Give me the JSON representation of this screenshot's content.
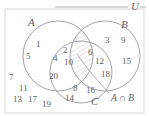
{
  "diagram": {
    "type": "venn-3-set",
    "universe_label": "U",
    "sets": [
      {
        "name": "A",
        "label": "A"
      },
      {
        "name": "B",
        "label": "B"
      },
      {
        "name": "C",
        "label": "C"
      }
    ],
    "annotation": {
      "label": "A ∩ B",
      "points_to": "A-intersect-B-region",
      "shading": "hatched"
    },
    "regions": [
      {
        "region": "A only",
        "values": [
          "1",
          "5"
        ]
      },
      {
        "region": "A and C only",
        "values": [
          "4",
          "2",
          "10",
          "20"
        ]
      },
      {
        "region": "B only",
        "values": [
          "3",
          "9",
          "15"
        ]
      },
      {
        "region": "B and C only",
        "values": [
          "6",
          "12",
          "18"
        ]
      },
      {
        "region": "C only",
        "values": [
          "8",
          "16",
          "14"
        ]
      },
      {
        "region": "outside (U only)",
        "values": [
          "7",
          "11",
          "13",
          "17",
          "19"
        ]
      }
    ],
    "elements": [
      {
        "id": "n1",
        "text": "1",
        "x": 36,
        "y": 40
      },
      {
        "id": "n5",
        "text": "5",
        "x": 26,
        "y": 52
      },
      {
        "id": "n4",
        "text": "4",
        "x": 53,
        "y": 54
      },
      {
        "id": "n2",
        "text": "2",
        "x": 63,
        "y": 46
      },
      {
        "id": "n10",
        "text": "10",
        "x": 64,
        "y": 58
      },
      {
        "id": "n20",
        "text": "20",
        "x": 49,
        "y": 72
      },
      {
        "id": "n6",
        "text": "6",
        "x": 88,
        "y": 48
      },
      {
        "id": "n12",
        "text": "12",
        "x": 95,
        "y": 57
      },
      {
        "id": "n18",
        "text": "18",
        "x": 101,
        "y": 70
      },
      {
        "id": "n3",
        "text": "3",
        "x": 105,
        "y": 37
      },
      {
        "id": "n9",
        "text": "9",
        "x": 121,
        "y": 37
      },
      {
        "id": "n15",
        "text": "15",
        "x": 122,
        "y": 57
      },
      {
        "id": "n8",
        "text": "8",
        "x": 73,
        "y": 84
      },
      {
        "id": "n16",
        "text": "16",
        "x": 86,
        "y": 86
      },
      {
        "id": "n14",
        "text": "14",
        "x": 65,
        "y": 94
      },
      {
        "id": "n7",
        "text": "7",
        "x": 9,
        "y": 73
      },
      {
        "id": "n11",
        "text": "11",
        "x": 19,
        "y": 84
      },
      {
        "id": "n13",
        "text": "13",
        "x": 13,
        "y": 95
      },
      {
        "id": "n17",
        "text": "17",
        "x": 28,
        "y": 95
      },
      {
        "id": "n19",
        "text": "19",
        "x": 42,
        "y": 100
      }
    ],
    "set_labels": [
      {
        "id": "label-A",
        "text": "A",
        "x": 28,
        "y": 17
      },
      {
        "id": "label-B",
        "text": "B",
        "x": 121,
        "y": 19
      },
      {
        "id": "label-C",
        "text": "C",
        "x": 91,
        "y": 96
      },
      {
        "id": "label-U",
        "text": "U",
        "x": 131,
        "y": 2
      }
    ],
    "annotation_label": {
      "id": "label-AB",
      "text": "A ∩ B",
      "x": 111,
      "y": 94
    },
    "colors": {
      "stroke": "#9a9a9c",
      "text": "#5b5c60",
      "frame": "#d9d9dc",
      "hatch": "#b4b4b6",
      "background": "#ffffff"
    }
  }
}
